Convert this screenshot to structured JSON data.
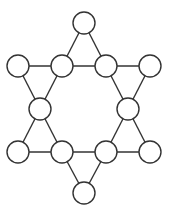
{
  "diagram": {
    "title": "",
    "node_radius": 11,
    "stroke": "#333333",
    "fill": "#ffffff",
    "nodes": [
      {
        "id": "n0",
        "x": 84,
        "y": 23
      },
      {
        "id": "n1",
        "x": 18,
        "y": 66
      },
      {
        "id": "n2",
        "x": 62,
        "y": 66
      },
      {
        "id": "n3",
        "x": 106,
        "y": 66
      },
      {
        "id": "n4",
        "x": 150,
        "y": 66
      },
      {
        "id": "n5",
        "x": 40,
        "y": 109
      },
      {
        "id": "n6",
        "x": 128,
        "y": 109
      },
      {
        "id": "n7",
        "x": 18,
        "y": 152
      },
      {
        "id": "n8",
        "x": 62,
        "y": 152
      },
      {
        "id": "n9",
        "x": 106,
        "y": 152
      },
      {
        "id": "n10",
        "x": 150,
        "y": 152
      },
      {
        "id": "n11",
        "x": 84,
        "y": 193
      }
    ],
    "edges": [
      [
        "n0",
        "n2"
      ],
      [
        "n0",
        "n3"
      ],
      [
        "n1",
        "n2"
      ],
      [
        "n2",
        "n3"
      ],
      [
        "n3",
        "n4"
      ],
      [
        "n1",
        "n5"
      ],
      [
        "n2",
        "n5"
      ],
      [
        "n4",
        "n6"
      ],
      [
        "n3",
        "n6"
      ],
      [
        "n5",
        "n7"
      ],
      [
        "n5",
        "n8"
      ],
      [
        "n6",
        "n9"
      ],
      [
        "n6",
        "n10"
      ],
      [
        "n7",
        "n8"
      ],
      [
        "n8",
        "n9"
      ],
      [
        "n9",
        "n10"
      ],
      [
        "n8",
        "n11"
      ],
      [
        "n9",
        "n11"
      ]
    ]
  }
}
